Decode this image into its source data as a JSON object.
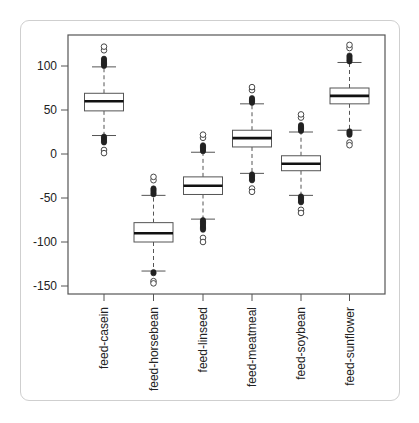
{
  "chart_data": {
    "type": "box",
    "title": "",
    "xlabel": "",
    "ylabel": "",
    "ylim": [
      -160,
      128
    ],
    "yticks": [
      100,
      50,
      0,
      -50,
      -100,
      -150
    ],
    "grid": false,
    "legend": null,
    "categories": [
      "feed-casein",
      "feed-horsebean",
      "feed-linseed",
      "feed-meatmeal",
      "feed-soybean",
      "feed-sunflower"
    ],
    "series": [
      {
        "name": "feed-casein",
        "whisker_low": 21,
        "q1": 49,
        "median": 60,
        "q3": 69,
        "whisker_high": 99,
        "outlier_min": 1,
        "outlier_max": 122
      },
      {
        "name": "feed-horsebean",
        "whisker_low": -133,
        "q1": -100,
        "median": -90,
        "q3": -78,
        "whisker_high": -47,
        "outlier_min": -147,
        "outlier_max": -26
      },
      {
        "name": "feed-linseed",
        "whisker_low": -74,
        "q1": -46,
        "median": -36,
        "q3": -26,
        "whisker_high": 2,
        "outlier_min": -100,
        "outlier_max": 22
      },
      {
        "name": "feed-meatmeal",
        "whisker_low": -22,
        "q1": 8,
        "median": 18,
        "q3": 27,
        "whisker_high": 57,
        "outlier_min": -43,
        "outlier_max": 76
      },
      {
        "name": "feed-soybean",
        "whisker_low": -47,
        "q1": -19,
        "median": -11,
        "q3": -2,
        "whisker_high": 25,
        "outlier_min": -67,
        "outlier_max": 45
      },
      {
        "name": "feed-sunflower",
        "whisker_low": 27,
        "q1": 57,
        "median": 66,
        "q3": 75,
        "whisker_high": 104,
        "outlier_min": 10,
        "outlier_max": 124
      }
    ]
  },
  "style": {
    "frame_color": "#555555",
    "box_color": "#555555",
    "median_color": "#111111",
    "card_border": "#cfcfcf"
  }
}
